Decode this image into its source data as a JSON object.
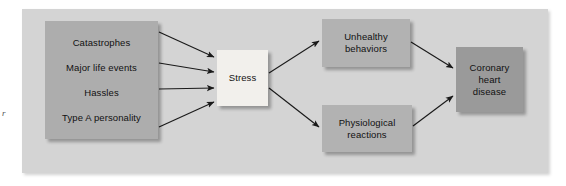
{
  "figure": {
    "panel_color": "#d4d4d4",
    "background_color": "#ffffff",
    "left_margin_mark": "r"
  },
  "nodes": {
    "stressors": {
      "name": "stressors",
      "fill": "#adadad",
      "lines": [
        "Catastrophes",
        "Major life events",
        "Hassles",
        "Type A personality"
      ]
    },
    "stress": {
      "name": "stress",
      "fill": "#f2f0ec",
      "lines": [
        "Stress"
      ]
    },
    "unhealthy": {
      "name": "unhealthy-behaviors",
      "fill": "#b2b2b2",
      "lines": [
        "Unhealthy",
        "behaviors"
      ]
    },
    "physiological": {
      "name": "physiological-reactions",
      "fill": "#b2b2b2",
      "lines": [
        "Physiological",
        "reactions"
      ]
    },
    "coronary": {
      "name": "coronary-heart-disease",
      "fill": "#9a9a9a",
      "lines": [
        "Coronary",
        "heart",
        "disease"
      ]
    }
  },
  "edges": [
    {
      "id": "e1",
      "from": "stressors",
      "to": "stress",
      "label": ""
    },
    {
      "id": "e2",
      "from": "stressors",
      "to": "stress",
      "label": ""
    },
    {
      "id": "e3",
      "from": "stressors",
      "to": "stress",
      "label": ""
    },
    {
      "id": "e4",
      "from": "stressors",
      "to": "stress",
      "label": ""
    },
    {
      "id": "e5",
      "from": "stress",
      "to": "unhealthy",
      "label": ""
    },
    {
      "id": "e6",
      "from": "stress",
      "to": "physiological",
      "label": ""
    },
    {
      "id": "e7",
      "from": "unhealthy",
      "to": "coronary",
      "label": ""
    },
    {
      "id": "e8",
      "from": "physiological",
      "to": "coronary",
      "label": ""
    }
  ],
  "arrow_color": "#1a1a1a"
}
